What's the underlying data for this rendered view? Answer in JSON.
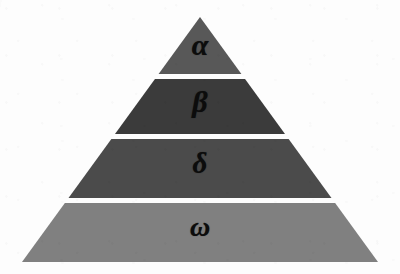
{
  "diagram": {
    "type": "pyramid",
    "orientation": "apex-up",
    "tier_count": 4,
    "background_color": "#fdfdfd",
    "divider_color": "#ffffff",
    "label_color": "#0c0c0c",
    "geometry": {
      "apex_x": 200,
      "apex_y": 17,
      "base_left_x": 22,
      "base_right_x": 378,
      "base_y": 262
    },
    "tiers": [
      {
        "rank": 1,
        "position": "top",
        "label": "α",
        "label_name": "alpha",
        "fill_color": "#585858",
        "top_y": 17,
        "bottom_y": 74,
        "label_x": 200,
        "label_y": 45,
        "label_size": 30
      },
      {
        "rank": 2,
        "position": "upper-middle",
        "label": "β",
        "label_name": "beta",
        "fill_color": "#3b3b3b",
        "top_y": 79,
        "bottom_y": 134,
        "label_x": 200,
        "label_y": 102,
        "label_size": 30
      },
      {
        "rank": 3,
        "position": "lower-middle",
        "label": "δ",
        "label_name": "delta",
        "fill_color": "#4b4b4b",
        "top_y": 139,
        "bottom_y": 198,
        "label_x": 200,
        "label_y": 163,
        "label_size": 29
      },
      {
        "rank": 4,
        "position": "bottom",
        "label": "ω",
        "label_name": "omega",
        "fill_color": "#808080",
        "top_y": 203,
        "bottom_y": 262,
        "label_x": 200,
        "label_y": 227,
        "label_size": 28
      }
    ]
  }
}
